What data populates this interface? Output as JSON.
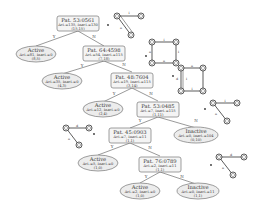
{
  "diagram": {
    "type": "decision-tree",
    "branch_labels": {
      "yes": "Y",
      "no": "N"
    },
    "nodes": [
      {
        "id": "n0",
        "kind": "split",
        "title": "Pat. 53:0561",
        "counts": "Act.=135, Inact.=130",
        "pair": "(15,15)"
      },
      {
        "id": "n1",
        "kind": "leaf",
        "title": "Active",
        "counts": "Act.=81, Inact.=0",
        "pair": "(8,5)"
      },
      {
        "id": "n2",
        "kind": "split",
        "title": "Pat. 64:4598",
        "counts": "Act.=54, Inact.=115",
        "pair": "(7,18)"
      },
      {
        "id": "n3",
        "kind": "leaf",
        "title": "Active",
        "counts": "Act.=35, Inact.=0",
        "pair": "(4,3)"
      },
      {
        "id": "n4",
        "kind": "split",
        "title": "Pat. 48:7604",
        "counts": "Act.=19, Inact.=115",
        "pair": "(3,14)"
      },
      {
        "id": "n5",
        "kind": "leaf",
        "title": "Active",
        "counts": "Act.=12, Inact.=0",
        "pair": "(2,4)"
      },
      {
        "id": "n6",
        "kind": "split",
        "title": "Pat. 53:0485",
        "counts": "Act.=7, Inact.=115",
        "pair": "(1,11)"
      },
      {
        "id": "n7",
        "kind": "split",
        "title": "Pat. 45:0903",
        "counts": "Act.=7, Inact.=11",
        "pair": "(1,1)"
      },
      {
        "id": "n8",
        "kind": "leaf",
        "title": "Inactive",
        "counts": "Act.=0, Inact.=104",
        "pair": "(0,10)"
      },
      {
        "id": "n9",
        "kind": "leaf",
        "title": "Active",
        "counts": "Act.=5, Inact.=0",
        "pair": "(1,0)"
      },
      {
        "id": "n10",
        "kind": "split",
        "title": "Pat. 76:0789",
        "counts": "Act.=2, Inact.=11",
        "pair": "(1,1)"
      },
      {
        "id": "n11",
        "kind": "leaf",
        "title": "Active",
        "counts": "Act.=2, Inact.=0",
        "pair": "(1,0)"
      },
      {
        "id": "n12",
        "kind": "leaf",
        "title": "Inactive",
        "counts": "Act.=0, Inact.=11",
        "pair": "(1,1)"
      }
    ],
    "pattern_graphs": [
      {
        "for": "Pat. 53:0561",
        "edge_labels": [
          "i",
          "a"
        ]
      },
      {
        "for": "Pat. 64:4598",
        "edge_labels": [
          "i",
          "a",
          "i",
          "a"
        ]
      },
      {
        "for": "Pat. 48:7604",
        "edge_labels": [
          "a",
          "i",
          "d",
          "i"
        ]
      },
      {
        "for": "Pat. 53:0485",
        "edge_labels": [
          "i",
          "a"
        ]
      },
      {
        "for": "Pat. 45:0903",
        "edge_labels": [
          "d",
          "a"
        ]
      },
      {
        "for": "Pat. 76:0789",
        "edge_labels": [
          "d",
          "a"
        ]
      }
    ]
  }
}
